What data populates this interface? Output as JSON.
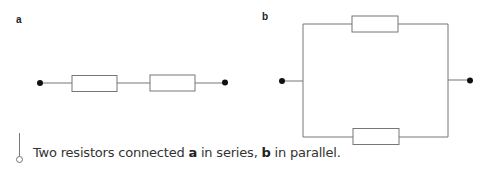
{
  "panels": {
    "a": {
      "label": "a",
      "description": "series circuit",
      "resistors": 2
    },
    "b": {
      "label": "b",
      "description": "parallel circuit",
      "resistors": 2
    }
  },
  "caption": {
    "prefix": "Two resistors connected ",
    "a_label": "a",
    "middle": " in series, ",
    "b_label": "b",
    "suffix": " in parallel."
  },
  "colors": {
    "wire": "#777777",
    "terminal": "#111111",
    "text": "#333333"
  }
}
